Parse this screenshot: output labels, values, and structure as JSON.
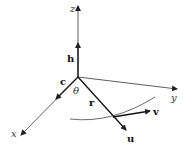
{
  "diagram": {
    "type": "3d-coordinate-vector-diagram",
    "axes": {
      "x": {
        "label": "x"
      },
      "y": {
        "label": "y"
      },
      "z": {
        "label": "z"
      }
    },
    "vectors": {
      "h": {
        "label": "h"
      },
      "c": {
        "label": "c"
      },
      "r": {
        "label": "r"
      },
      "u": {
        "label": "u"
      },
      "v": {
        "label": "v"
      }
    },
    "angle": {
      "label": "θ"
    },
    "colors": {
      "line": "#333333",
      "vector": "#111111",
      "background": "#ffffff"
    }
  }
}
